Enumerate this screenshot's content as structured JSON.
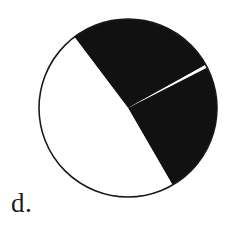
{
  "figure": {
    "label": "d.",
    "caption_position": "bottom-left",
    "background_color": "#ffffff",
    "outline_color": "#1a1a1a",
    "fill_color": "#111111",
    "unshaded_color": "#ffffff"
  },
  "chart_data": {
    "type": "pie",
    "title": "",
    "subtitle": "",
    "xlabel": "",
    "ylabel": "",
    "legend": [],
    "grid": false,
    "center_x": 128,
    "center_y": 108,
    "radius": 89,
    "outline_width": 1.6,
    "start_angle_convention": "degrees, 0 = east (right), positive = counterclockwise",
    "labels": [
      "shaded-upper",
      "sliver-gap",
      "shaded-lower",
      "unshaded"
    ],
    "values": [
      98,
      2,
      87,
      173
    ],
    "value_unit": "degrees",
    "fractions": [
      0.272,
      0.006,
      0.242,
      0.481
    ],
    "slices": [
      {
        "name": "shaded-upper",
        "shaded": true,
        "color": "#111111",
        "start_angle": 29,
        "end_angle": 127,
        "sweep_degrees": 98,
        "fraction": 0.272
      },
      {
        "name": "sliver-gap",
        "shaded": false,
        "color": "#ffffff",
        "start_angle": 27,
        "end_angle": 29,
        "sweep_degrees": 2,
        "fraction": 0.006
      },
      {
        "name": "shaded-lower",
        "shaded": true,
        "color": "#111111",
        "start_angle": -60,
        "end_angle": 27,
        "sweep_degrees": 87,
        "fraction": 0.242
      },
      {
        "name": "unshaded",
        "shaded": false,
        "color": "#ffffff",
        "start_angle": 127,
        "end_angle": 300,
        "sweep_degrees": 173,
        "fraction": 0.481
      }
    ],
    "boundary_points": [
      {
        "name": "upper-left-radius-end",
        "x": 78,
        "y": 40
      },
      {
        "name": "sliver-radius-end",
        "x": 205,
        "y": 66
      },
      {
        "name": "lower-right-radius-end",
        "x": 178,
        "y": 196
      }
    ],
    "shaded_total_degrees": 185,
    "shaded_total_fraction": 0.514
  }
}
